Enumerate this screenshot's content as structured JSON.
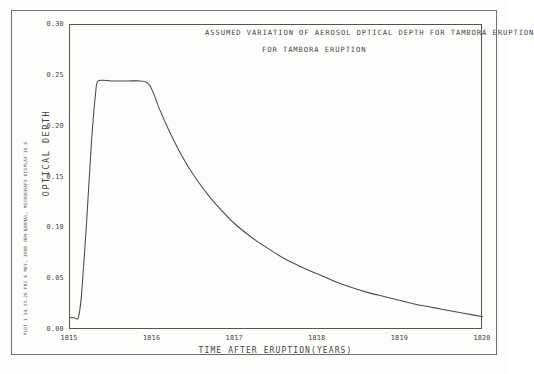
{
  "figure": {
    "title_line_1": "ASSUMED VARIATION OF AEROSOL OPTICAL DEPTH",
    "title_line_2": "FOR TAMBORA ERUPTION",
    "plot_stamp": "PLOT 1   14.33.20  FRI  6 MAY, 1988   JBM-NORMAL, MICROGRAFX DISPLAY 10.0",
    "line_color": "#4a4a48",
    "frame_color": "#6f6f6f"
  },
  "chart_data": {
    "type": "line",
    "title": "ASSUMED VARIATION OF AEROSOL OPTICAL DEPTH FOR TAMBORA ERUPTION",
    "xlabel": "TIME AFTER ERUPTION(YEARS)",
    "ylabel": "OPTICAL DEPTH",
    "xlim": [
      1815,
      1820
    ],
    "ylim": [
      0.0,
      0.3
    ],
    "grid": false,
    "legend": "none",
    "x_ticks": [
      1815,
      1816,
      1817,
      1818,
      1819,
      1820
    ],
    "x_tick_labels": [
      "1815",
      "1816",
      "1817",
      "1818",
      "1819",
      "1820"
    ],
    "x_minor_tick_step": 0.2,
    "y_ticks": [
      0.0,
      0.05,
      0.1,
      0.15,
      0.2,
      0.25,
      0.3
    ],
    "y_tick_labels": [
      "0.00",
      "0.05",
      "0.10",
      "0.15",
      "0.20",
      "0.25",
      "0.30"
    ],
    "baseline_value": 0.012,
    "peak_value": 0.245,
    "plateau_start": 1815.33,
    "plateau_end": 1815.95,
    "rise_start": 1815.1,
    "series": [
      {
        "name": "Aerosol optical depth",
        "x": [
          1815.0,
          1815.05,
          1815.1,
          1815.14,
          1815.2,
          1815.26,
          1815.31,
          1815.34,
          1815.5,
          1815.7,
          1815.85,
          1815.92,
          1815.97,
          1816.02,
          1816.08,
          1816.2,
          1816.35,
          1816.5,
          1816.7,
          1816.9,
          1817.0,
          1817.2,
          1817.4,
          1817.6,
          1817.8,
          1818.0,
          1818.2,
          1818.4,
          1818.6,
          1818.8,
          1819.0,
          1819.2,
          1819.4,
          1819.6,
          1819.8,
          1820.0
        ],
        "y": [
          0.012,
          0.012,
          0.012,
          0.035,
          0.105,
          0.185,
          0.233,
          0.245,
          0.245,
          0.245,
          0.245,
          0.244,
          0.24,
          0.231,
          0.218,
          0.196,
          0.172,
          0.152,
          0.13,
          0.112,
          0.104,
          0.091,
          0.08,
          0.07,
          0.062,
          0.055,
          0.048,
          0.042,
          0.037,
          0.033,
          0.029,
          0.025,
          0.022,
          0.019,
          0.016,
          0.013
        ]
      }
    ]
  }
}
